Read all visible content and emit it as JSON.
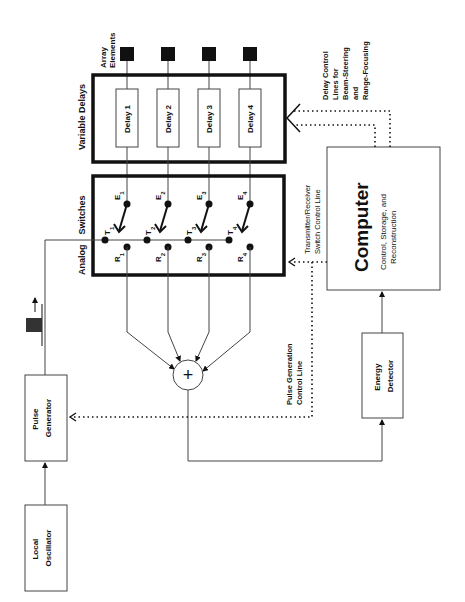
{
  "diagram": {
    "orientation": "rotated-90-ccw",
    "blocks": {
      "local_oscillator": {
        "line1": "Local",
        "line2": "Oscillator"
      },
      "pulse_generator": {
        "line1": "Pulse",
        "line2": "Generator"
      },
      "energy_detector": {
        "line1": "Energy",
        "line2": "Detector"
      },
      "computer": {
        "title": "Computer",
        "line1": "Control, Storage, and",
        "line2": "Reconstruction"
      },
      "variable_delays": {
        "label": "Variable Delays"
      },
      "analog_switches": {
        "label1": "Analog",
        "label2": "Switches"
      },
      "array_elements": {
        "line1": "Array",
        "line2": "Elements"
      }
    },
    "delays": [
      "Delay 1",
      "Delay 2",
      "Delay 3",
      "Delay 4"
    ],
    "switches": [
      {
        "e": "E",
        "t": "T",
        "r": "R",
        "sub": "1"
      },
      {
        "e": "E",
        "t": "T",
        "r": "R",
        "sub": "2"
      },
      {
        "e": "E",
        "t": "T",
        "r": "R",
        "sub": "3"
      },
      {
        "e": "E",
        "t": "T",
        "r": "R",
        "sub": "4"
      }
    ],
    "summer_symbol": "+",
    "annotations": {
      "delay_control": [
        "Delay Control",
        "Lines for",
        "Beam-Steering",
        "and",
        "Range-Focusing"
      ],
      "tr_switch": [
        "Transmitter/Receiver",
        "Switch Control Line"
      ],
      "pulse_gen_control": [
        "Pulse Generation",
        "Control Line"
      ]
    },
    "colors": {
      "line": "#111111",
      "background": "#ffffff",
      "thin_line": "#444444"
    }
  }
}
